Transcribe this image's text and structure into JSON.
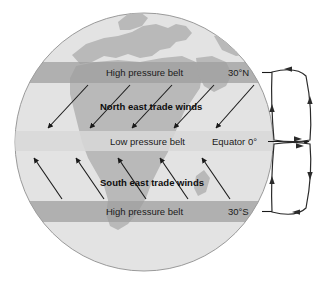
{
  "diagram": {
    "globe": {
      "ocean_color": "#e3e3e3",
      "land_color": "#b9b9b9",
      "outline_color": "#9a9a9a",
      "center_x": 144,
      "center_y": 142,
      "radius": 129
    },
    "bands": [
      {
        "id": "high-pressure-north",
        "label": "High pressure belt",
        "latitude_label": "30°N",
        "color": "#9d9d9d",
        "y": 62,
        "height": 21
      },
      {
        "id": "low-pressure-equator",
        "label": "Low pressure belt",
        "latitude_label": "Equator 0°",
        "color": "#d0d0d0",
        "y": 131,
        "height": 20
      },
      {
        "id": "high-pressure-south",
        "label": "High pressure belt",
        "latitude_label": "30°S",
        "color": "#9d9d9d",
        "y": 201,
        "height": 21
      }
    ],
    "wind_zones": [
      {
        "id": "north-east-trade-winds",
        "label": "North east trade winds",
        "label_x": 100,
        "label_y": 110,
        "arrow_count": 5,
        "direction": "down-left"
      },
      {
        "id": "south-east-trade-winds",
        "label": "South east trade winds",
        "label_x": 100,
        "label_y": 186,
        "arrow_count": 5,
        "direction": "up-left"
      }
    ],
    "equator_arrow": {
      "label": "Equator 0°",
      "direction": "right"
    },
    "circulation_cells": [
      {
        "id": "hadley-cell-north",
        "rotation": "counterclockwise",
        "arrow_count": 4
      },
      {
        "id": "hadley-cell-south",
        "rotation": "counterclockwise",
        "arrow_count": 4
      }
    ],
    "colors": {
      "arrow": "#1a1a1a",
      "background": "#ffffff",
      "cell_fill": "#ffffff",
      "cell_stroke": "#2b2b2b"
    }
  }
}
